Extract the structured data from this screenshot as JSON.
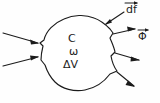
{
  "figure": {
    "background_color": "#fefefe",
    "ink_color": "#1b1b1b",
    "width": 160,
    "height": 103
  },
  "region": {
    "name": "control-volume-blob",
    "description": "irregular hand-drawn closed contour"
  },
  "interior_labels": {
    "c": "C",
    "omega": "ω",
    "delta_v": "ΔV"
  },
  "vector_labels": {
    "df": "df",
    "phi": "Φ"
  },
  "arrows": {
    "incoming": [
      {
        "name": "incoming-arrow-upper",
        "direction": "right"
      },
      {
        "name": "incoming-arrow-lower",
        "direction": "right"
      }
    ],
    "outgoing": [
      {
        "name": "outgoing-arrow-upper",
        "direction": "up-right"
      },
      {
        "name": "outgoing-arrow-middle",
        "direction": "right"
      },
      {
        "name": "outgoing-arrow-lower",
        "direction": "down-right"
      }
    ],
    "surface_element": {
      "name": "df-arrow",
      "direction": "down-left-toward-boundary"
    }
  }
}
